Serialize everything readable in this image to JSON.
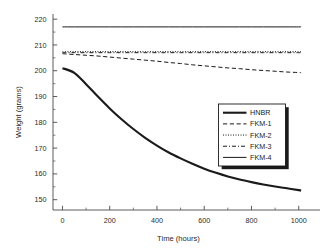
{
  "chart_data": {
    "type": "line",
    "title": "",
    "xlabel": "Time (hours)",
    "ylabel": "Weight (grams)",
    "xlim": [
      -40,
      1090
    ],
    "ylim": [
      146,
      222
    ],
    "grid": false,
    "legend_position": "center-right",
    "x_ticks": [
      0,
      200,
      400,
      600,
      800,
      1000
    ],
    "x_tick_labels": [
      "0",
      "200",
      "400",
      "600",
      "800",
      "1000"
    ],
    "x_minor_ticks": [
      100,
      300,
      500,
      700,
      900,
      1100
    ],
    "y_ticks": [
      150,
      160,
      170,
      180,
      190,
      200,
      210,
      220
    ],
    "y_tick_labels": [
      "150",
      "160",
      "170",
      "180",
      "190",
      "200",
      "210",
      "220"
    ],
    "y_minor_ticks": [
      155,
      165,
      175,
      185,
      195,
      205,
      215
    ],
    "x": [
      0,
      50,
      100,
      150,
      200,
      250,
      300,
      350,
      400,
      450,
      500,
      550,
      600,
      650,
      700,
      750,
      800,
      850,
      900,
      950,
      1000,
      1010
    ],
    "series": [
      {
        "name": "HNBR",
        "style": "solid",
        "width": 2.1,
        "values": [
          201.0,
          199.2,
          194.8,
          190.0,
          185.4,
          181.2,
          177.4,
          174.0,
          171.0,
          168.3,
          166.0,
          163.9,
          162.0,
          160.4,
          159.0,
          157.8,
          156.8,
          155.9,
          155.1,
          154.4,
          153.7,
          153.5
        ]
      },
      {
        "name": "FKM-1",
        "style": "dashed",
        "width": 1.0,
        "values": [
          206.6,
          206.3,
          206.0,
          205.7,
          205.3,
          204.9,
          204.5,
          204.1,
          203.7,
          203.2,
          202.8,
          202.3,
          201.9,
          201.5,
          201.1,
          200.8,
          200.4,
          200.1,
          199.8,
          199.5,
          199.3,
          199.2
        ]
      },
      {
        "name": "FKM-2",
        "style": "dotted",
        "width": 1.0,
        "values": [
          207.4,
          207.4,
          207.4,
          207.4,
          207.4,
          207.4,
          207.4,
          207.4,
          207.4,
          207.4,
          207.4,
          207.4,
          207.4,
          207.4,
          207.4,
          207.4,
          207.4,
          207.4,
          207.4,
          207.4,
          207.4,
          207.4
        ]
      },
      {
        "name": "FKM-3",
        "style": "dashdot",
        "width": 1.0,
        "values": [
          207.0,
          207.0,
          207.0,
          207.0,
          207.0,
          207.0,
          207.0,
          207.0,
          207.0,
          207.0,
          207.0,
          207.0,
          207.0,
          207.0,
          207.0,
          207.0,
          207.0,
          207.0,
          207.0,
          207.0,
          207.0,
          207.0
        ]
      },
      {
        "name": "FKM-4",
        "style": "solid",
        "width": 1.0,
        "values": [
          217.0,
          217.0,
          217.0,
          217.0,
          217.0,
          217.0,
          217.0,
          217.0,
          217.0,
          217.0,
          217.0,
          217.0,
          217.0,
          217.0,
          217.0,
          217.0,
          217.0,
          217.0,
          217.0,
          217.0,
          217.0,
          217.0
        ]
      }
    ],
    "legend_entries": [
      {
        "label": "HNBR",
        "style": "solid",
        "width": 2.1
      },
      {
        "label": "FKM-1",
        "style": "dashed",
        "width": 1.0
      },
      {
        "label": "FKM-2",
        "style": "dotted",
        "width": 1.0
      },
      {
        "label": "FKM-3",
        "style": "dashdot",
        "width": 1.0
      },
      {
        "label": "FKM-4",
        "style": "solid",
        "width": 1.0
      }
    ],
    "line_color": "#1a1a1a",
    "axis_color": "#4a4a4a",
    "background_color": "#ffffff"
  }
}
